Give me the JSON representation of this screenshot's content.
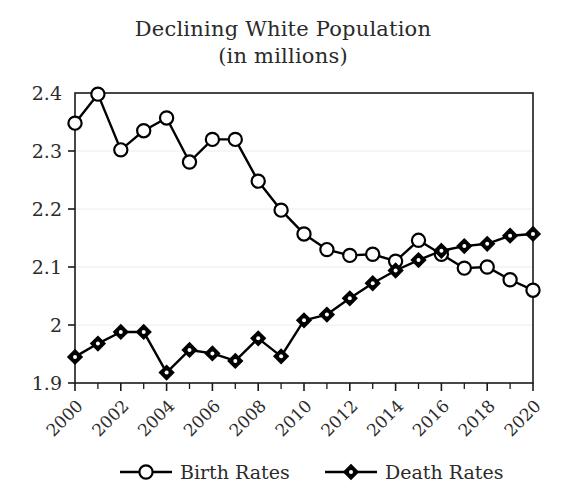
{
  "chart_data": {
    "type": "line",
    "title": "Declining White Population",
    "subtitle": "(in millions)",
    "xlabel": "",
    "ylabel": "",
    "x": [
      2000,
      2001,
      2002,
      2003,
      2004,
      2005,
      2006,
      2007,
      2008,
      2009,
      2010,
      2011,
      2012,
      2013,
      2014,
      2015,
      2016,
      2017,
      2018,
      2019,
      2020
    ],
    "xlim": [
      2000,
      2020
    ],
    "ylim": [
      1.9,
      2.4
    ],
    "yticks": [
      1.9,
      2.0,
      2.1,
      2.2,
      2.3,
      2.4
    ],
    "ytick_labels": [
      "1.9",
      "2",
      "2.1",
      "2.2",
      "2.3",
      "2.4"
    ],
    "xtick_labels": [
      "2000",
      "2002",
      "2004",
      "2006",
      "2008",
      "2010",
      "2012",
      "2014",
      "2016",
      "2018",
      "2020"
    ],
    "xtick_values": [
      2000,
      2002,
      2004,
      2006,
      2008,
      2010,
      2012,
      2014,
      2016,
      2018,
      2020
    ],
    "xtick_rotation": 45,
    "minor_xticks": [
      2001,
      2003,
      2005,
      2007,
      2009,
      2011,
      2013,
      2015,
      2017,
      2019
    ],
    "grid": {
      "horizontal": true,
      "vertical": false,
      "color": "#ececec"
    },
    "legend_position": "bottom",
    "series": [
      {
        "name": "Birth Rates",
        "marker": "open-circle",
        "color": "#000000",
        "values": [
          2.348,
          2.398,
          2.302,
          2.335,
          2.357,
          2.281,
          2.32,
          2.32,
          2.248,
          2.198,
          2.157,
          2.13,
          2.12,
          2.122,
          2.11,
          2.146,
          2.122,
          2.098,
          2.1,
          2.078,
          2.06
        ]
      },
      {
        "name": "Death Rates",
        "marker": "filled-diamond",
        "color": "#000000",
        "values": [
          1.945,
          1.968,
          1.988,
          1.988,
          1.918,
          1.957,
          1.951,
          1.938,
          1.977,
          1.946,
          2.008,
          2.018,
          2.046,
          2.072,
          2.094,
          2.112,
          2.128,
          2.136,
          2.14,
          2.154,
          2.157
        ]
      }
    ]
  },
  "legend": {
    "items": [
      {
        "label": "Birth Rates",
        "marker": "open-circle"
      },
      {
        "label": "Death Rates",
        "marker": "filled-diamond"
      }
    ]
  },
  "axis_frame": {
    "left": 75,
    "right": 533,
    "top": 93,
    "bottom": 383
  }
}
